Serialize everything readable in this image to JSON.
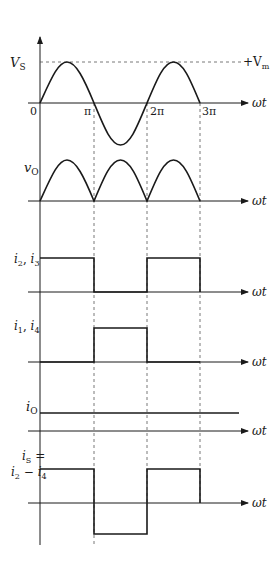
{
  "colors": {
    "ink": "#1a1a1a",
    "dash": "#555555",
    "background": "#ffffff"
  },
  "x_axis_label": "ωt",
  "tick_labels": {
    "zero": "0",
    "pi": "π",
    "two_pi": "2π",
    "three_pi": "3π"
  },
  "panels": [
    {
      "id": "vs",
      "label": "V",
      "label_sub": "S",
      "annotation": "+V",
      "annotation_sub": "m",
      "description": "Input sinusoid from 0 to 3π with peak +Vm"
    },
    {
      "id": "vo",
      "label": "v",
      "label_sub": "O",
      "description": "Full-wave rectified output, three positive half-sine humps"
    },
    {
      "id": "i23",
      "label": "i",
      "label_sub": "2",
      "label2": "i",
      "label2_sub": "3",
      "description": "High during 0–π and 2π–3π"
    },
    {
      "id": "i14",
      "label": "i",
      "label_sub": "1",
      "label2": "i",
      "label2_sub": "4",
      "description": "High during π–2π"
    },
    {
      "id": "io",
      "label": "i",
      "label_sub": "O",
      "description": "Constant DC output current"
    },
    {
      "id": "is",
      "label": "i",
      "label_sub": "S",
      "label_eq": "=",
      "label_line2a": "i",
      "label_line2a_sub": "2",
      "label_line2_op": " − ",
      "label_line2b": "i",
      "label_line2b_sub": "4",
      "description": "Square wave: positive 0–π, negative π–2π, positive 2π–3π"
    }
  ]
}
